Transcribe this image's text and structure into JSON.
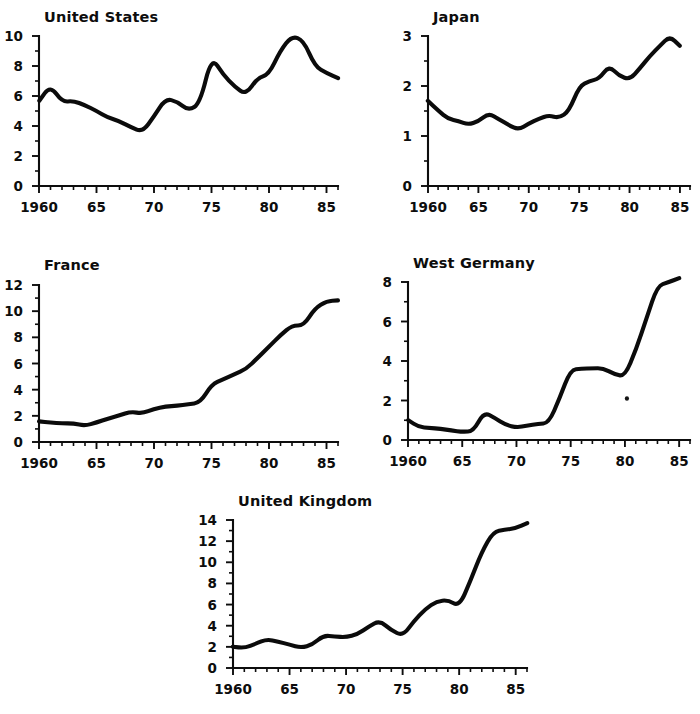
{
  "figure": {
    "background_color": "#ffffff",
    "line_color": "#0b0b0b",
    "text_color": "#0d0d0d"
  },
  "chart_data": [
    {
      "type": "line",
      "title": "United States",
      "xlabel": "",
      "ylabel": "",
      "xlim": [
        1960,
        1986
      ],
      "ylim": [
        0,
        10
      ],
      "yticks": [
        0,
        2,
        4,
        6,
        8,
        10
      ],
      "ytick_labels": [
        "0",
        "2",
        "4",
        "6",
        "8",
        "10"
      ],
      "yminor_ticks": [
        1,
        3,
        5,
        7,
        9
      ],
      "xticks": [
        1960,
        1965,
        1970,
        1975,
        1980,
        1985
      ],
      "xtick_labels": [
        "1960",
        "65",
        "70",
        "75",
        "80",
        "85"
      ],
      "grid": false,
      "legend": "none",
      "x": [
        1960,
        1961,
        1962,
        1963,
        1964,
        1965,
        1966,
        1967,
        1968,
        1969,
        1970,
        1971,
        1972,
        1973,
        1974,
        1975,
        1976,
        1977,
        1978,
        1979,
        1980,
        1981,
        1982,
        1983,
        1984,
        1985,
        1986
      ],
      "values": [
        5.7,
        6.7,
        5.6,
        5.7,
        5.4,
        5.0,
        4.6,
        4.3,
        3.9,
        3.6,
        4.6,
        5.8,
        5.6,
        5.0,
        5.5,
        8.6,
        7.4,
        6.6,
        6.1,
        7.2,
        7.4,
        9.0,
        10.0,
        9.7,
        8.0,
        7.5,
        7.2
      ],
      "note": "solid heavy black line, hand-drawn appearance"
    },
    {
      "type": "line",
      "title": "Japan",
      "xlabel": "",
      "ylabel": "",
      "xlim": [
        1960,
        1986
      ],
      "ylim": [
        0,
        3
      ],
      "yticks": [
        0,
        1,
        2,
        3
      ],
      "ytick_labels": [
        "0",
        "1",
        "2",
        "3"
      ],
      "yminor_ticks": [
        0.5,
        1.5,
        2.5
      ],
      "xticks": [
        1960,
        1965,
        1970,
        1975,
        1980,
        1985
      ],
      "xtick_labels": [
        "1960",
        "65",
        "70",
        "75",
        "80",
        "85"
      ],
      "grid": false,
      "legend": "none",
      "x": [
        1960,
        1961,
        1962,
        1963,
        1964,
        1965,
        1966,
        1967,
        1968,
        1969,
        1970,
        1971,
        1972,
        1973,
        1974,
        1975,
        1976,
        1977,
        1978,
        1979,
        1980,
        1981,
        1982,
        1983,
        1984,
        1985
      ],
      "values": [
        1.7,
        1.5,
        1.35,
        1.3,
        1.22,
        1.3,
        1.45,
        1.33,
        1.22,
        1.12,
        1.25,
        1.35,
        1.42,
        1.35,
        1.5,
        2.0,
        2.1,
        2.15,
        2.4,
        2.2,
        2.12,
        2.35,
        2.6,
        2.8,
        3.0,
        2.8
      ],
      "note": "solid heavy black line, hand-drawn appearance"
    },
    {
      "type": "line",
      "title": "France",
      "xlabel": "",
      "ylabel": "",
      "xlim": [
        1960,
        1986
      ],
      "ylim": [
        0,
        12
      ],
      "yticks": [
        0,
        2,
        4,
        6,
        8,
        10,
        12
      ],
      "ytick_labels": [
        "0",
        "2",
        "4",
        "6",
        "8",
        "10",
        "12"
      ],
      "yminor_ticks": [
        1,
        3,
        5,
        7,
        9,
        11
      ],
      "xticks": [
        1960,
        1965,
        1970,
        1975,
        1980,
        1985
      ],
      "xtick_labels": [
        "1960",
        "65",
        "70",
        "75",
        "80",
        "85"
      ],
      "grid": false,
      "legend": "none",
      "x": [
        1960,
        1961,
        1962,
        1963,
        1964,
        1965,
        1966,
        1967,
        1968,
        1969,
        1970,
        1971,
        1972,
        1973,
        1974,
        1975,
        1976,
        1977,
        1978,
        1979,
        1980,
        1981,
        1982,
        1983,
        1984,
        1985,
        1986
      ],
      "values": [
        1.6,
        1.45,
        1.42,
        1.4,
        1.25,
        1.5,
        1.8,
        2.0,
        2.3,
        2.2,
        2.5,
        2.7,
        2.8,
        2.85,
        3.0,
        4.4,
        4.8,
        5.2,
        5.6,
        6.4,
        7.3,
        8.2,
        8.9,
        8.9,
        10.2,
        10.8,
        10.8
      ],
      "note": "solid heavy black line, hand-drawn appearance"
    },
    {
      "type": "line",
      "title": "West Germany",
      "xlabel": "",
      "ylabel": "",
      "xlim": [
        1960,
        1986
      ],
      "ylim": [
        0,
        8
      ],
      "yticks": [
        0,
        2,
        4,
        6,
        8
      ],
      "ytick_labels": [
        "0",
        "2",
        "4",
        "6",
        "8"
      ],
      "yminor_ticks": [
        1,
        3,
        5,
        7
      ],
      "xticks": [
        1960,
        1965,
        1970,
        1975,
        1980,
        1985
      ],
      "xtick_labels": [
        "1960",
        "65",
        "70",
        "75",
        "80",
        "85"
      ],
      "grid": false,
      "legend": "none",
      "x": [
        1960,
        1961,
        1962,
        1963,
        1964,
        1965,
        1966,
        1967,
        1968,
        1969,
        1970,
        1971,
        1972,
        1973,
        1974,
        1975,
        1976,
        1977,
        1978,
        1979,
        1980,
        1981,
        1982,
        1983,
        1984,
        1985
      ],
      "values": [
        1.0,
        0.65,
        0.62,
        0.55,
        0.48,
        0.4,
        0.45,
        1.4,
        1.1,
        0.78,
        0.65,
        0.72,
        0.8,
        0.85,
        2.1,
        3.55,
        3.6,
        3.65,
        3.65,
        3.35,
        3.2,
        4.6,
        6.2,
        7.8,
        8.0,
        8.2
      ],
      "note": "solid heavy black line; small stray ink speck near x=1980, y=2.1"
    },
    {
      "type": "line",
      "title": "United Kingdom",
      "xlabel": "",
      "ylabel": "",
      "xlim": [
        1960,
        1986
      ],
      "ylim": [
        0,
        14
      ],
      "yticks": [
        0,
        2,
        4,
        6,
        8,
        10,
        12,
        14
      ],
      "ytick_labels": [
        "0",
        "2",
        "4",
        "6",
        "8",
        "10",
        "12",
        "14"
      ],
      "yminor_ticks": [
        1,
        3,
        5,
        7,
        9,
        11,
        13
      ],
      "xticks": [
        1960,
        1965,
        1970,
        1975,
        1980,
        1985
      ],
      "xtick_labels": [
        "1960",
        "65",
        "70",
        "75",
        "80",
        "85"
      ],
      "grid": false,
      "legend": "none",
      "x": [
        1960,
        1961,
        1962,
        1963,
        1964,
        1965,
        1966,
        1967,
        1968,
        1969,
        1970,
        1971,
        1972,
        1973,
        1974,
        1975,
        1976,
        1977,
        1978,
        1979,
        1980,
        1981,
        1982,
        1983,
        1984,
        1985,
        1986
      ],
      "values": [
        2.05,
        1.85,
        2.3,
        2.7,
        2.5,
        2.2,
        1.95,
        2.2,
        3.1,
        3.0,
        2.9,
        3.2,
        3.9,
        4.5,
        3.6,
        3.0,
        4.4,
        5.6,
        6.3,
        6.4,
        5.8,
        8.2,
        11.0,
        12.9,
        13.1,
        13.2,
        13.7
      ],
      "note": "solid heavy black line, hand-drawn appearance"
    }
  ],
  "panels": [
    {
      "id": "united-states",
      "title": "United States"
    },
    {
      "id": "japan",
      "title": "Japan"
    },
    {
      "id": "france",
      "title": "France"
    },
    {
      "id": "west-germany",
      "title": "West Germany"
    },
    {
      "id": "united-kingdom",
      "title": "United Kingdom"
    }
  ]
}
